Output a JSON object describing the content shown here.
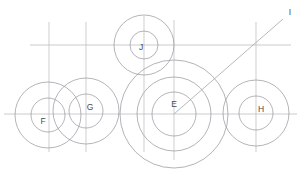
{
  "drawing": {
    "title": "Geometric circle construction",
    "width": 301,
    "height": 176,
    "background_color": "#ffffff",
    "stroke_color_circle": "#9b9ba2",
    "stroke_color_construction": "#b9b9bd",
    "label_color": "#4a4a4f"
  },
  "labels": {
    "e": "E",
    "f": "F",
    "g": "G",
    "h": "H",
    "i": "I",
    "j": "J"
  },
  "chart_data": {
    "type": "scatter",
    "xlabel": "",
    "ylabel": "",
    "xlim": [
      0,
      301
    ],
    "ylim": [
      0,
      176
    ],
    "grid": false,
    "legend": "none",
    "circle_groups": [
      {
        "label": "F",
        "cx": 48,
        "cy": 115,
        "radii": [
          17,
          33
        ],
        "label_x": 43,
        "label_y": 122
      },
      {
        "label": "G",
        "cx": 86,
        "cy": 111,
        "radii": [
          17,
          33
        ],
        "label_x": 90,
        "label_y": 108
      },
      {
        "label": "E",
        "cx": 174,
        "cy": 114,
        "radii": [
          22,
          37,
          54
        ],
        "label_x": 174,
        "label_y": 105
      },
      {
        "label": "H",
        "cx": 256,
        "cy": 113,
        "radii": [
          17,
          33
        ],
        "label_x": 261,
        "label_y": 110
      },
      {
        "label": "J",
        "cx": 144,
        "cy": 45,
        "radii": [
          14,
          30
        ],
        "label_x": 141,
        "label_y": 48
      }
    ],
    "horizontal_lines": [
      {
        "y": 45,
        "x1": 30,
        "x2": 291
      },
      {
        "y": 114,
        "x1": 4,
        "x2": 297
      }
    ],
    "vertical_lines": [
      {
        "x": 49,
        "y1": 22,
        "y2": 152
      },
      {
        "x": 86,
        "y1": 22,
        "y2": 152
      },
      {
        "x": 144,
        "y1": 16,
        "y2": 152
      },
      {
        "x": 174,
        "y1": 20,
        "y2": 160
      },
      {
        "x": 256,
        "y1": 22,
        "y2": 152
      }
    ],
    "leader_line": {
      "label": "I",
      "x1": 174,
      "y1": 114,
      "x2": 283,
      "y2": 19,
      "label_x": 290,
      "label_y": 13
    }
  }
}
